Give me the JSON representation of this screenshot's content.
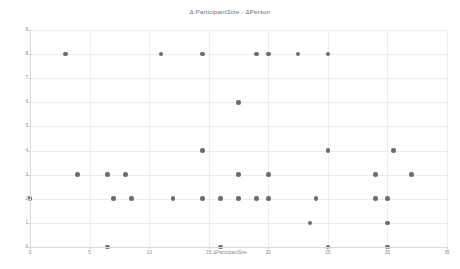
{
  "chart_data": {
    "type": "scatter",
    "title": "Δ ParticipantSize - ΔPerson",
    "xlabel": "ΔParticipantSize",
    "ylabel": "ΔPerson",
    "xlim": [
      0,
      35
    ],
    "ylim": [
      0,
      9
    ],
    "xticks": [
      0,
      5,
      10,
      15,
      20,
      25,
      30,
      35
    ],
    "xticklabels": [
      "0",
      "5",
      "10",
      "15",
      "20",
      "25",
      "30",
      "35"
    ],
    "yticks": [
      0,
      1,
      2,
      3,
      4,
      5,
      6,
      7,
      8,
      9
    ],
    "yticklabels": [
      "0",
      "1",
      "2",
      "3",
      "4",
      "5",
      "6",
      "7",
      "8",
      "9"
    ],
    "grid": true,
    "legend": null,
    "marker_color": "#6b6b6b",
    "marker_size": 4.6,
    "background_color": "#ffffff",
    "grid_color": "#ededed",
    "points": [
      {
        "x": 3,
        "y": 8
      },
      {
        "x": 11,
        "y": 8
      },
      {
        "x": 14.5,
        "y": 8
      },
      {
        "x": 19,
        "y": 8
      },
      {
        "x": 20,
        "y": 8
      },
      {
        "x": 22.5,
        "y": 8
      },
      {
        "x": 25,
        "y": 8
      },
      {
        "x": 17.5,
        "y": 6
      },
      {
        "x": 14.5,
        "y": 4
      },
      {
        "x": 25,
        "y": 4
      },
      {
        "x": 30.5,
        "y": 4
      },
      {
        "x": 4,
        "y": 3
      },
      {
        "x": 6.5,
        "y": 3
      },
      {
        "x": 8,
        "y": 3
      },
      {
        "x": 17.5,
        "y": 3
      },
      {
        "x": 20,
        "y": 3
      },
      {
        "x": 29,
        "y": 3
      },
      {
        "x": 32,
        "y": 3
      },
      {
        "x": 0,
        "y": 2
      },
      {
        "x": 7,
        "y": 2
      },
      {
        "x": 8.5,
        "y": 2
      },
      {
        "x": 12,
        "y": 2
      },
      {
        "x": 14.5,
        "y": 2
      },
      {
        "x": 16,
        "y": 2
      },
      {
        "x": 17.5,
        "y": 2
      },
      {
        "x": 19,
        "y": 2
      },
      {
        "x": 20,
        "y": 2
      },
      {
        "x": 24,
        "y": 2
      },
      {
        "x": 29,
        "y": 2
      },
      {
        "x": 30,
        "y": 2
      },
      {
        "x": 23.5,
        "y": 1
      },
      {
        "x": 30,
        "y": 1
      },
      {
        "x": 6.5,
        "y": 0
      },
      {
        "x": 16,
        "y": 0
      },
      {
        "x": 25,
        "y": 0
      },
      {
        "x": 30,
        "y": 0
      }
    ]
  }
}
